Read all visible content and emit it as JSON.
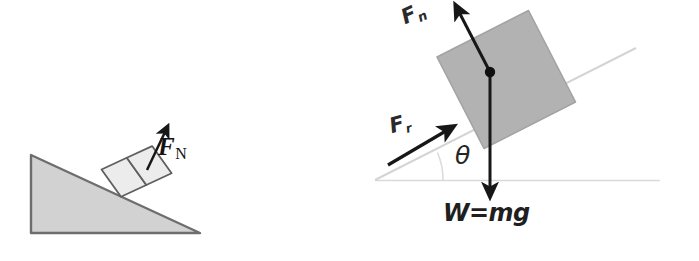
{
  "figure": {
    "background_color": "#ffffff"
  },
  "colors": {
    "incline_fill": "#d2d2d2",
    "incline_stroke": "#6e6e6e",
    "small_block_fill": "#ececec",
    "small_block_stroke": "#5f5f5f",
    "tilted_block_fill": "#b2b2b2",
    "tilted_block_stroke": "#9a9a9a",
    "arrow_color": "#171717",
    "guide_line_color": "#d8d8d8",
    "label_color": "#1f1f1f",
    "dot_color": "#101010"
  },
  "left_diagram": {
    "name": "normal-force-on-incline",
    "incline": {
      "shape": "right-triangle",
      "fill": "#d2d2d2",
      "points": "31,155 31,233 200,233",
      "angle_label": ""
    },
    "blocks": [
      {
        "label": "",
        "fill": "#ececec"
      },
      {
        "label": "",
        "fill": "#ececec"
      }
    ],
    "arrows": [
      {
        "name": "normal-force-arrow",
        "label": "F",
        "subscript": "N",
        "direction": "up-right perpendicular to incline"
      }
    ],
    "labels": {
      "normal_force": "F",
      "normal_force_subscript": "N"
    }
  },
  "right_diagram": {
    "name": "block-on-incline-force-diagram",
    "incline_line": {
      "from": [
        375,
        180
      ],
      "to": [
        636,
        48
      ],
      "color": "#d8d8d8"
    },
    "horizontal_line": {
      "from": [
        375,
        180
      ],
      "to": [
        660,
        180
      ],
      "color": "#d8d8d8",
      "style": "faint"
    },
    "block": {
      "fill": "#b2b2b2",
      "rotation_deg": -27,
      "center_dot": true
    },
    "arrows": [
      {
        "name": "normal-force-arrow",
        "label": "F",
        "subscript": "n",
        "from": [
          490,
          72
        ],
        "to": [
          456,
          6
        ],
        "description": "normal force perpendicular to incline surface"
      },
      {
        "name": "friction-force-arrow",
        "label": "F",
        "subscript": "r",
        "from": [
          389,
          164
        ],
        "to": [
          451,
          127
        ],
        "description": "friction force up the incline"
      },
      {
        "name": "weight-force-arrow",
        "label": "W=mg",
        "subscript": "",
        "from": [
          490,
          72
        ],
        "to": [
          490,
          197
        ],
        "description": "weight acting vertically downward"
      }
    ],
    "labels": {
      "normal_force": "F",
      "normal_force_subscript": "n",
      "friction_force": "F",
      "friction_force_subscript": "r",
      "angle": "θ",
      "weight": "W=mg"
    }
  }
}
